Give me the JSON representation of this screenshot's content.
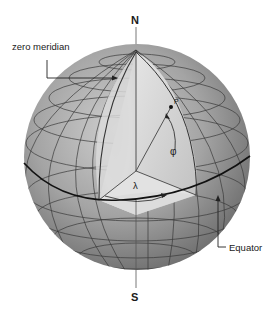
{
  "diagram": {
    "labels": {
      "north": "N",
      "south": "S",
      "zero_meridian": "zero meridian",
      "equator": "Equator",
      "longitude": "λ",
      "latitude": "φ",
      "point": "P"
    },
    "colors": {
      "background": "#ffffff",
      "sphere_dark": "#6e6e6e",
      "sphere_mid": "#9a9a9a",
      "sphere_light": "#c9c9c9",
      "cutaway_light": "#e6e6e6",
      "cutaway_dark": "#b5b5b5",
      "grid_line": "#3a3a3a",
      "text": "#1a1a1a"
    }
  }
}
